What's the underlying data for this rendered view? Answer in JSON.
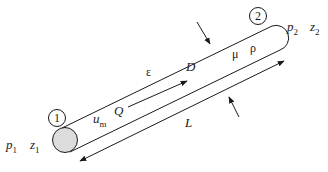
{
  "diagram": {
    "stations": [
      {
        "id": "1",
        "pressure": "p",
        "pressure_sub": "1",
        "elevation": "z",
        "elevation_sub": "1"
      },
      {
        "id": "2",
        "pressure": "p",
        "pressure_sub": "2",
        "elevation": "z",
        "elevation_sub": "2"
      }
    ],
    "labels": {
      "roughness": "ε",
      "velocity": "u",
      "velocity_sub": "m",
      "flow_rate": "Q",
      "diameter": "D",
      "viscosity": "μ",
      "density": "ρ",
      "length": "L"
    },
    "colors": {
      "stroke": "#1a1a1a",
      "inlet_fill": "#dcdcdc"
    }
  }
}
